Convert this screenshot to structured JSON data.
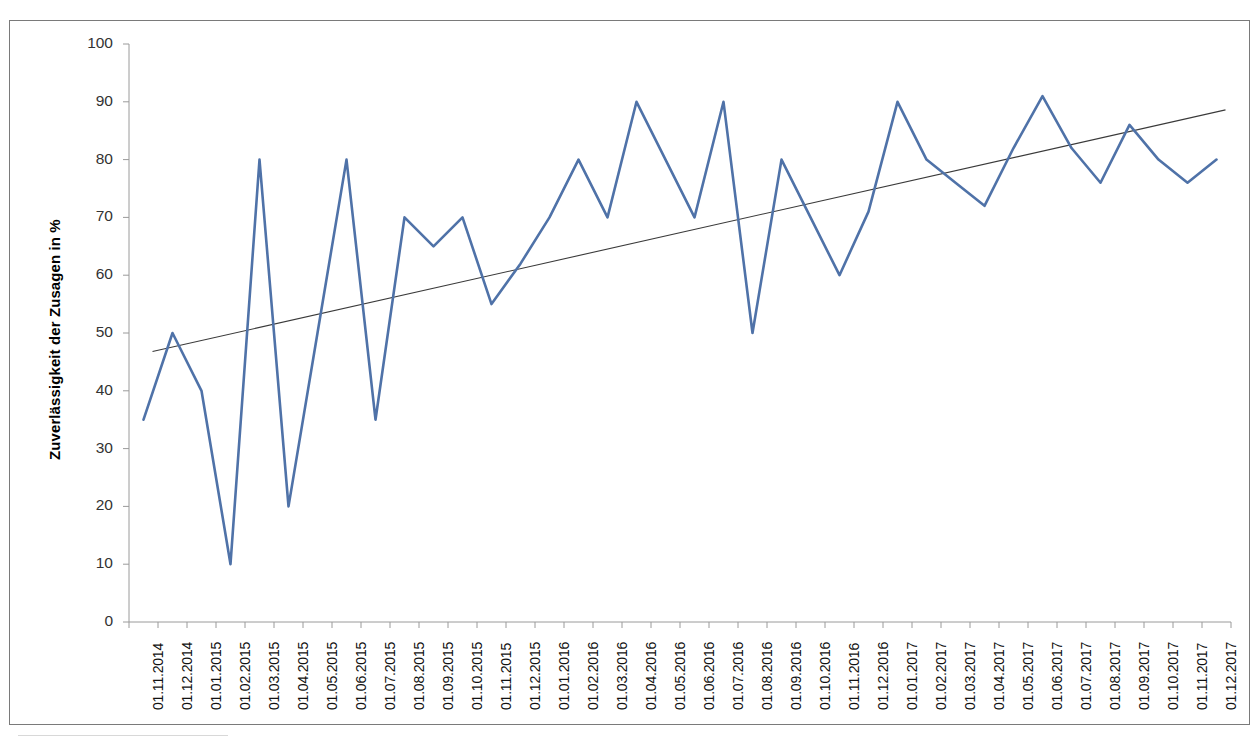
{
  "chart_data": {
    "type": "line",
    "title": "",
    "xlabel": "",
    "ylabel": "Zuverlässigkeit der Zusagen in %",
    "ylim": [
      0,
      100
    ],
    "ytick_labels": [
      "0",
      "10",
      "20",
      "30",
      "40",
      "50",
      "60",
      "70",
      "80",
      "90",
      "100"
    ],
    "yticks": [
      0,
      10,
      20,
      30,
      40,
      50,
      60,
      70,
      80,
      90,
      100
    ],
    "grid": false,
    "legend": "none",
    "categories": [
      "01.11.2014",
      "01.12.2014",
      "01.01.2015",
      "01.02.2015",
      "01.03.2015",
      "01.04.2015",
      "01.05.2015",
      "01.06.2015",
      "01.07.2015",
      "01.08.2015",
      "01.09.2015",
      "01.10.2015",
      "01.11.2015",
      "01.12.2015",
      "01.01.2016",
      "01.02.2016",
      "01.03.2016",
      "01.04.2016",
      "01.05.2016",
      "01.06.2016",
      "01.07.2016",
      "01.08.2016",
      "01.09.2016",
      "01.10.2016",
      "01.11.2016",
      "01.12.2016",
      "01.01.2017",
      "01.02.2017",
      "01.03.2017",
      "01.04.2017",
      "01.05.2017",
      "01.06.2017",
      "01.07.2017",
      "01.08.2017",
      "01.09.2017",
      "01.10.2017",
      "01.11.2017",
      "01.12.2017"
    ],
    "series": [
      {
        "name": "Zuverlässigkeit der Zusagen",
        "color": "#4f72a8",
        "style": "line",
        "values": [
          35,
          50,
          40,
          10,
          80,
          20,
          50,
          80,
          35,
          70,
          65,
          70,
          55,
          62,
          70,
          80,
          70,
          90,
          80,
          70,
          90,
          50,
          80,
          70,
          60,
          71,
          90,
          80,
          76,
          72,
          82,
          91,
          82,
          76,
          86,
          80,
          76,
          80
        ]
      },
      {
        "name": "Linearer Trend",
        "color": "#3a3a3a",
        "style": "trendline",
        "start_value": 46.8,
        "end_value": 88.6
      }
    ]
  }
}
